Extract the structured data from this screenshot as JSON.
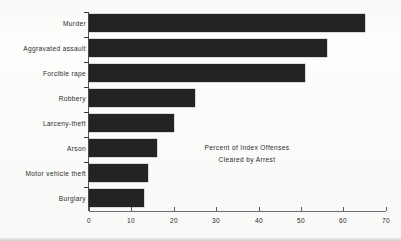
{
  "chart_data": {
    "type": "bar",
    "orientation": "horizontal",
    "title": "",
    "subtitle": "",
    "annotation_lines": [
      "Percent of  Index Offenses",
      "Cleared by Arrest"
    ],
    "categories": [
      "Murder",
      "Aggravated assault",
      "Forcible rape",
      "Robbery",
      "Larceny-theft",
      "Arson",
      "Motor vehicle theft",
      "Burglary"
    ],
    "values": [
      65,
      56,
      51,
      25,
      20,
      16,
      14,
      13
    ],
    "xlabel": "",
    "ylabel": "",
    "xlim": [
      0,
      70
    ],
    "xticks": [
      0,
      10,
      20,
      30,
      40,
      50,
      60,
      70
    ],
    "xtick_labels": [
      "0",
      "10",
      "20",
      "30",
      "40",
      "50",
      "60",
      "70"
    ],
    "grid": false,
    "legend": false,
    "bar_color": "#232323",
    "axis_color": "#6f6f6f",
    "text_color": "#2b2b2b"
  }
}
